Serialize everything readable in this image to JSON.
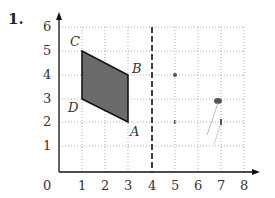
{
  "problem": {
    "number": "1."
  },
  "axes": {
    "x_ticks": [
      "0",
      "1",
      "2",
      "3",
      "4",
      "5",
      "6",
      "7",
      "8"
    ],
    "y_ticks": [
      "1",
      "2",
      "3",
      "4",
      "5",
      "6"
    ]
  },
  "shape": {
    "fill": "#6b6b6b",
    "stroke": "#111111",
    "vertices": [
      {
        "label": "C",
        "x": 1,
        "y": 5
      },
      {
        "label": "B",
        "x": 3,
        "y": 4
      },
      {
        "label": "A",
        "x": 3,
        "y": 2
      },
      {
        "label": "D",
        "x": 1,
        "y": 3
      }
    ]
  },
  "mirror_line": {
    "type": "dashed",
    "x": 4
  },
  "marks": [
    {
      "x": 5,
      "y": 4
    },
    {
      "x": 7,
      "y": 3
    }
  ]
}
